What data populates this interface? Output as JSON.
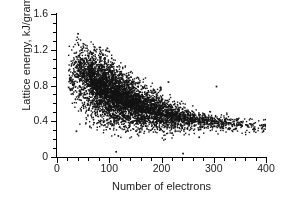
{
  "chart_data": {
    "type": "scatter",
    "title": "",
    "xlabel": "Number of electrons",
    "ylabel": "Lattice energy, kJ/gram",
    "xlim": [
      0,
      400
    ],
    "ylim": [
      0,
      1.6
    ],
    "xticks": [
      0,
      100,
      200,
      300,
      400
    ],
    "yticks": [
      0,
      0.4,
      0.8,
      1.2,
      1.6
    ],
    "xtick_labels": [
      "0",
      "100",
      "200",
      "300",
      "400"
    ],
    "ytick_labels": [
      "0",
      "0.4",
      "0.8",
      "1.2",
      "1.6"
    ],
    "x_minor_tick_step": 20,
    "y_minor_tick_step": 0.1,
    "grid": false,
    "legend": null,
    "marker": {
      "shape": "square",
      "color": "#141414",
      "size_px": 1.4
    },
    "axis_style": "open-L (left and bottom spines only)",
    "n_points_approx": 6000,
    "density_profile": [
      {
        "x": 25,
        "y_median": 0.85,
        "y_low": 0.5,
        "y_high": 1.2,
        "weight": 0.02
      },
      {
        "x": 40,
        "y_median": 0.88,
        "y_low": 0.42,
        "y_high": 1.35,
        "weight": 0.06
      },
      {
        "x": 60,
        "y_median": 0.8,
        "y_low": 0.35,
        "y_high": 1.25,
        "weight": 0.11
      },
      {
        "x": 80,
        "y_median": 0.72,
        "y_low": 0.32,
        "y_high": 1.2,
        "weight": 0.14
      },
      {
        "x": 100,
        "y_median": 0.65,
        "y_low": 0.28,
        "y_high": 1.15,
        "weight": 0.14
      },
      {
        "x": 120,
        "y_median": 0.6,
        "y_low": 0.26,
        "y_high": 1.05,
        "weight": 0.12
      },
      {
        "x": 140,
        "y_median": 0.55,
        "y_low": 0.26,
        "y_high": 0.92,
        "weight": 0.1
      },
      {
        "x": 160,
        "y_median": 0.51,
        "y_low": 0.25,
        "y_high": 0.85,
        "weight": 0.08
      },
      {
        "x": 180,
        "y_median": 0.48,
        "y_low": 0.24,
        "y_high": 0.8,
        "weight": 0.07
      },
      {
        "x": 200,
        "y_median": 0.45,
        "y_low": 0.24,
        "y_high": 0.72,
        "weight": 0.05
      },
      {
        "x": 220,
        "y_median": 0.43,
        "y_low": 0.23,
        "y_high": 0.62,
        "weight": 0.04
      },
      {
        "x": 240,
        "y_median": 0.41,
        "y_low": 0.22,
        "y_high": 0.58,
        "weight": 0.03
      },
      {
        "x": 260,
        "y_median": 0.39,
        "y_low": 0.24,
        "y_high": 0.52,
        "weight": 0.022
      },
      {
        "x": 280,
        "y_median": 0.38,
        "y_low": 0.25,
        "y_high": 0.5,
        "weight": 0.018
      },
      {
        "x": 300,
        "y_median": 0.37,
        "y_low": 0.25,
        "y_high": 0.48,
        "weight": 0.014
      },
      {
        "x": 320,
        "y_median": 0.36,
        "y_low": 0.25,
        "y_high": 0.46,
        "weight": 0.01
      },
      {
        "x": 340,
        "y_median": 0.35,
        "y_low": 0.24,
        "y_high": 0.45,
        "weight": 0.008
      },
      {
        "x": 360,
        "y_median": 0.34,
        "y_low": 0.24,
        "y_high": 0.44,
        "weight": 0.005
      },
      {
        "x": 380,
        "y_median": 0.33,
        "y_low": 0.24,
        "y_high": 0.42,
        "weight": 0.003
      },
      {
        "x": 397,
        "y_median": 0.31,
        "y_low": 0.24,
        "y_high": 0.4,
        "weight": 0.002
      }
    ],
    "notable_outliers": [
      {
        "x": 305,
        "y": 0.79,
        "note": "isolated high point in sparse right region"
      },
      {
        "x": 213,
        "y": 0.84,
        "note": "isolated high point"
      },
      {
        "x": 113,
        "y": 0.06,
        "note": "isolated low point near baseline"
      },
      {
        "x": 241,
        "y": 0.04,
        "note": "isolated low point near baseline"
      },
      {
        "x": 22,
        "y": 0.78,
        "note": "leftmost isolated point"
      },
      {
        "x": 40,
        "y": 1.38,
        "note": "topmost point"
      },
      {
        "x": 37,
        "y": 0.29,
        "note": "low-left isolated point"
      }
    ]
  }
}
